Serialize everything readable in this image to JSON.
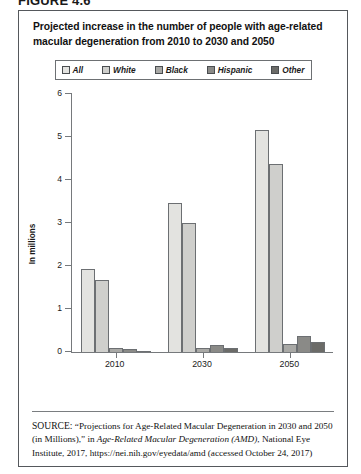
{
  "figure": {
    "label": "FIGURE 4.6"
  },
  "chart_title": "Projected increase in the number of people with age-related macular degeneration from 2010 to 2030 and 2050",
  "source_note": {
    "keyword": "SOURCE:",
    "part1": " “Projections for Age-Related Macular Degeneration in 2030 and 2050 (in Millions),” in ",
    "italic1": "Age-Related Macular Degeneration (AMD)",
    "part2": ", National Eye Institute, 2017, https://nei.nih.gov/eyedata/amd (accessed October 24, 2017)"
  },
  "chart_data": {
    "type": "bar",
    "title": "Projected increase in the number of people with age-related macular degeneration from 2010 to 2030 and 2050",
    "xlabel": "",
    "ylabel": "In millions",
    "categories": [
      "2010",
      "2030",
      "2050"
    ],
    "ylim": [
      0,
      6
    ],
    "yticks": [
      0,
      1,
      2,
      3,
      4,
      5,
      6
    ],
    "ytick_labels": [
      "0",
      "1",
      "2",
      "3",
      "4",
      "5",
      "6"
    ],
    "grid": false,
    "legend_position": "top-center",
    "series": [
      {
        "name": "All",
        "color": "#e3e3e0",
        "values": [
          1.93,
          3.48,
          5.17
        ]
      },
      {
        "name": "White",
        "color": "#cfcfcc",
        "values": [
          1.68,
          3.01,
          4.38
        ]
      },
      {
        "name": "Black",
        "color": "#a9a9a6",
        "values": [
          0.1,
          0.11,
          0.2
        ]
      },
      {
        "name": "Hispanic",
        "color": "#8a8a87",
        "values": [
          0.07,
          0.17,
          0.37
        ]
      },
      {
        "name": "Other",
        "color": "#6b6b68",
        "values": [
          0.04,
          0.11,
          0.24
        ]
      }
    ]
  }
}
